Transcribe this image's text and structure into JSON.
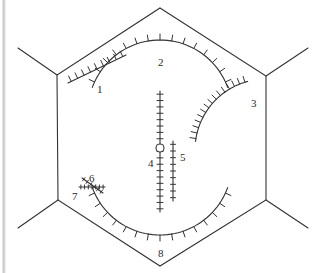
{
  "figure": {
    "title": "",
    "background_color": "#ffffff",
    "stroke_color": "#333333",
    "label_color": "#2a2a2a",
    "width": 320,
    "height": 273
  },
  "scrollbar": {
    "name": "left-scroll-edge",
    "color": "#c9c9c9"
  },
  "hexagon": {
    "name": "hexagon-outline",
    "vertices": [
      [
        160,
        8
      ],
      [
        266,
        76
      ],
      [
        266,
        200
      ],
      [
        160,
        266
      ],
      [
        58,
        200
      ],
      [
        57,
        75
      ]
    ],
    "spurs": [
      [
        [
          57,
          75
        ],
        [
          18,
          48
        ]
      ],
      [
        [
          266,
          76
        ],
        [
          308,
          48
        ]
      ],
      [
        [
          266,
          200
        ],
        [
          308,
          228
        ]
      ],
      [
        [
          58,
          200
        ],
        [
          18,
          228
        ]
      ]
    ]
  },
  "symbols": [
    {
      "id": "1",
      "label": "1",
      "type": "ticked-line",
      "label_pos": [
        97,
        84
      ],
      "geometry": {
        "kind": "line",
        "x1": 68,
        "y1": 83,
        "x2": 126,
        "y2": 55
      },
      "tick_count": 9,
      "tick_length": 6,
      "tick_side": "above"
    },
    {
      "id": "2",
      "label": "2",
      "type": "ticked-arc",
      "label_pos": [
        158,
        57
      ],
      "geometry": {
        "kind": "arc",
        "cx": 160,
        "cy": 112,
        "r": 72,
        "a1": 200,
        "a2": 340
      },
      "tick_count": 15,
      "tick_length": 6,
      "tick_side": "outward"
    },
    {
      "id": "3",
      "label": "3",
      "type": "ticked-arc",
      "label_pos": [
        251,
        98
      ],
      "geometry": {
        "kind": "arc",
        "cx": 266,
        "cy": 150,
        "r": 71,
        "a1": 187,
        "a2": 255
      },
      "tick_count": 15,
      "tick_length": 6,
      "tick_side": "outward"
    },
    {
      "id": "4",
      "label": "4",
      "type": "ticked-line-with-circle",
      "label_pos": [
        148,
        158
      ],
      "geometry": {
        "kind": "line",
        "x1": 160,
        "y1": 91,
        "x2": 160,
        "y2": 212
      },
      "tick_count": 19,
      "tick_length": 6,
      "tick_side": "both",
      "marker": {
        "kind": "circle",
        "cx": 160,
        "cy": 148,
        "r": 4
      }
    },
    {
      "id": "5",
      "label": "5",
      "type": "ticked-line",
      "label_pos": [
        180,
        152
      ],
      "geometry": {
        "kind": "line",
        "x1": 173,
        "y1": 141,
        "x2": 173,
        "y2": 201
      },
      "tick_count": 9,
      "tick_length": 5,
      "tick_side": "both"
    },
    {
      "id": "6",
      "label": "6",
      "type": "ticked-line-short",
      "label_pos": [
        89,
        173
      ],
      "geometry": {
        "kind": "line",
        "x1": 82,
        "y1": 178,
        "x2": 103,
        "y2": 193
      },
      "tick_count": 6,
      "tick_length": 4,
      "tick_side": "both"
    },
    {
      "id": "7",
      "label": "7",
      "type": "ticked-line-short",
      "label_pos": [
        72,
        191
      ],
      "geometry": {
        "kind": "line",
        "x1": 79,
        "y1": 187,
        "x2": 105,
        "y2": 187
      },
      "tick_count": 7,
      "tick_length": 4,
      "tick_side": "both"
    },
    {
      "id": "8",
      "label": "8",
      "type": "ticked-arc",
      "label_pos": [
        158,
        248
      ],
      "geometry": {
        "kind": "arc",
        "cx": 160,
        "cy": 163,
        "r": 72,
        "a1": 20,
        "a2": 160
      },
      "tick_count": 15,
      "tick_length": 6,
      "tick_side": "outward"
    }
  ]
}
